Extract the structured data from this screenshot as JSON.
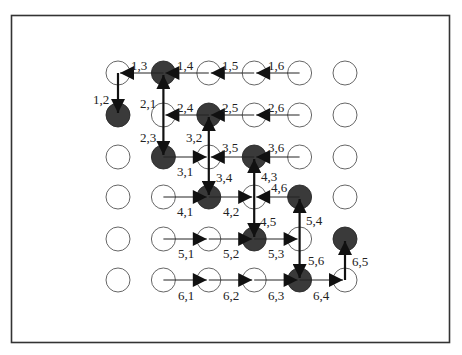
{
  "figure": {
    "grid": {
      "rows": 6,
      "cols": 6,
      "x0": 118,
      "dx": 45.4,
      "ys": [
        73,
        115,
        157,
        197,
        239,
        280
      ],
      "radius": 12
    },
    "filled_nodes": [
      [
        1,
        2
      ],
      [
        2,
        1
      ],
      [
        2,
        3
      ],
      [
        3,
        2
      ],
      [
        3,
        4
      ],
      [
        4,
        3
      ],
      [
        4,
        5
      ],
      [
        5,
        4
      ],
      [
        5,
        6
      ],
      [
        6,
        5
      ]
    ],
    "junction_nodes": [
      [
        2,
        2
      ],
      [
        3,
        3
      ],
      [
        4,
        4
      ],
      [
        5,
        5
      ]
    ],
    "edges": [
      {
        "label": "1,2",
        "from": [
          1,
          1
        ],
        "to": [
          2,
          1
        ],
        "thick": true
      },
      {
        "label": "1,3",
        "from": [
          1,
          2
        ],
        "to": [
          1,
          1
        ],
        "thick": false
      },
      {
        "label": "1,4",
        "from": [
          1,
          3
        ],
        "to": [
          1,
          2
        ],
        "thick": false
      },
      {
        "label": "1,5",
        "from": [
          1,
          4
        ],
        "to": [
          1,
          3
        ],
        "thick": false
      },
      {
        "label": "1,6",
        "from": [
          1,
          5
        ],
        "to": [
          1,
          4
        ],
        "thick": false
      },
      {
        "label": "2,1",
        "from": [
          2,
          2
        ],
        "to": [
          1,
          2
        ],
        "thick": true
      },
      {
        "label": "2,3",
        "from": [
          2,
          2
        ],
        "to": [
          3,
          2
        ],
        "thick": true
      },
      {
        "label": "2,4",
        "from": [
          2,
          3
        ],
        "to": [
          2,
          2
        ],
        "thick": false
      },
      {
        "label": "2,5",
        "from": [
          2,
          4
        ],
        "to": [
          2,
          3
        ],
        "thick": false
      },
      {
        "label": "2,6",
        "from": [
          2,
          5
        ],
        "to": [
          2,
          4
        ],
        "thick": false
      },
      {
        "label": "3,1",
        "from": [
          3,
          2
        ],
        "to": [
          3,
          3
        ],
        "thick": false
      },
      {
        "label": "3,2",
        "from": [
          3,
          3
        ],
        "to": [
          2,
          3
        ],
        "thick": true
      },
      {
        "label": "3,4",
        "from": [
          3,
          3
        ],
        "to": [
          4,
          3
        ],
        "thick": true
      },
      {
        "label": "3,5",
        "from": [
          3,
          4
        ],
        "to": [
          3,
          3
        ],
        "thick": false
      },
      {
        "label": "3,6",
        "from": [
          3,
          5
        ],
        "to": [
          3,
          4
        ],
        "thick": false
      },
      {
        "label": "4,1",
        "from": [
          4,
          2
        ],
        "to": [
          4,
          3
        ],
        "thick": false
      },
      {
        "label": "4,2",
        "from": [
          4,
          3
        ],
        "to": [
          4,
          4
        ],
        "thick": false
      },
      {
        "label": "4,3",
        "from": [
          4,
          4
        ],
        "to": [
          3,
          4
        ],
        "thick": true
      },
      {
        "label": "4,5",
        "from": [
          4,
          4
        ],
        "to": [
          5,
          4
        ],
        "thick": true
      },
      {
        "label": "4,6",
        "from": [
          4,
          5
        ],
        "to": [
          4,
          4
        ],
        "thick": false
      },
      {
        "label": "5,1",
        "from": [
          5,
          2
        ],
        "to": [
          5,
          3
        ],
        "thick": false
      },
      {
        "label": "5,2",
        "from": [
          5,
          3
        ],
        "to": [
          5,
          4
        ],
        "thick": false
      },
      {
        "label": "5,3",
        "from": [
          5,
          4
        ],
        "to": [
          5,
          5
        ],
        "thick": false
      },
      {
        "label": "5,4",
        "from": [
          5,
          5
        ],
        "to": [
          4,
          5
        ],
        "thick": true
      },
      {
        "label": "5,6",
        "from": [
          5,
          5
        ],
        "to": [
          6,
          5
        ],
        "thick": true
      },
      {
        "label": "6,1",
        "from": [
          6,
          2
        ],
        "to": [
          6,
          3
        ],
        "thick": false
      },
      {
        "label": "6,2",
        "from": [
          6,
          3
        ],
        "to": [
          6,
          4
        ],
        "thick": false
      },
      {
        "label": "6,3",
        "from": [
          6,
          4
        ],
        "to": [
          6,
          5
        ],
        "thick": false
      },
      {
        "label": "6,4",
        "from": [
          6,
          5
        ],
        "to": [
          6,
          6
        ],
        "thick": false
      },
      {
        "label": "6,5",
        "from": [
          6,
          6
        ],
        "to": [
          5,
          6
        ],
        "thick": true
      }
    ],
    "label_positions": {
      "1,2": [
        93,
        104
      ],
      "1,3": [
        131,
        70
      ],
      "1,4": [
        177,
        70
      ],
      "1,5": [
        222,
        70
      ],
      "1,6": [
        268,
        70
      ],
      "2,1": [
        140,
        108
      ],
      "2,3": [
        140,
        142
      ],
      "2,4": [
        177,
        112
      ],
      "2,5": [
        222,
        112
      ],
      "2,6": [
        268,
        112
      ],
      "3,1": [
        177,
        176
      ],
      "3,2": [
        186,
        142
      ],
      "3,4": [
        216,
        182
      ],
      "3,5": [
        222,
        152
      ],
      "3,6": [
        268,
        152
      ],
      "4,1": [
        177,
        216
      ],
      "4,2": [
        223,
        216
      ],
      "4,3": [
        261,
        181
      ],
      "4,5": [
        260,
        226
      ],
      "4,6": [
        271,
        192
      ],
      "5,1": [
        178,
        258
      ],
      "5,2": [
        223,
        258
      ],
      "5,3": [
        268,
        258
      ],
      "5,4": [
        306,
        225
      ],
      "5,6": [
        308,
        265
      ],
      "6,1": [
        178,
        300
      ],
      "6,2": [
        223,
        300
      ],
      "6,3": [
        268,
        300
      ],
      "6,4": [
        313,
        300
      ],
      "6,5": [
        352,
        266
      ]
    }
  }
}
